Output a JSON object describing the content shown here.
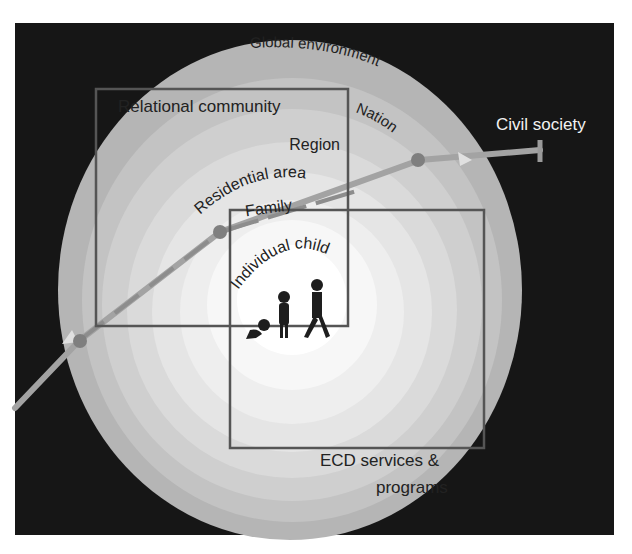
{
  "diagram": {
    "type": "nested-ecological-model",
    "rings": [
      {
        "label": "Global environment",
        "level": 1
      },
      {
        "label": "Nation",
        "level": 2
      },
      {
        "label": "Region",
        "level": 3
      },
      {
        "label": "Residential area",
        "level": 4
      },
      {
        "label": "Family",
        "level": 5
      },
      {
        "label": "Individual child",
        "level": 6
      }
    ],
    "boxes": [
      {
        "label": "Relational community"
      },
      {
        "label_line1": "ECD services &",
        "label_line2": "programs"
      }
    ],
    "arrow": {
      "label": "Civil society"
    },
    "figures": [
      "baby-crawling",
      "child-standing",
      "adult-walking"
    ],
    "colors": {
      "background": "#161616",
      "ring_outer": "#b8b8b8",
      "ring_inner": "#ffffff",
      "box_stroke": "#555555",
      "arrow": "#9a9a9a",
      "node": "#7a7a7a",
      "label_dark": "#222222",
      "label_light": "#f2f2f2"
    }
  }
}
